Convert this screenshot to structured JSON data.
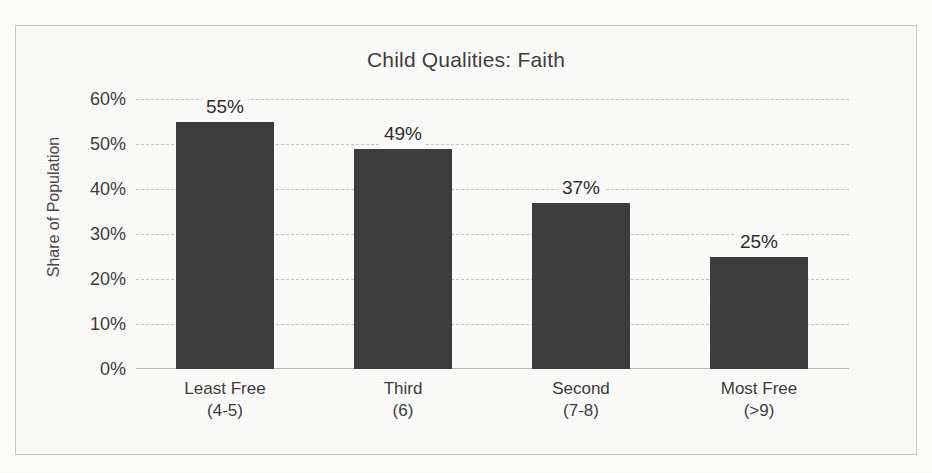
{
  "chart_data": {
    "type": "bar",
    "title": "Child Qualities: Faith",
    "xlabel": "",
    "ylabel": "Share of Population",
    "ylim": [
      0,
      60
    ],
    "grid": true,
    "legend": "none",
    "y_tick_labels": [
      "60%",
      "50%",
      "40%",
      "30%",
      "20%",
      "10%",
      "0%"
    ],
    "y_tick_values": [
      60,
      50,
      40,
      30,
      20,
      10,
      0
    ],
    "categories": [
      "Least Free",
      "Third",
      "Second",
      "Most Free"
    ],
    "category_sublabels": [
      "(4-5)",
      "(6)",
      "(7-8)",
      "(>9)"
    ],
    "values": [
      55,
      49,
      37,
      25
    ],
    "data_labels": [
      "55%",
      "49%",
      "37%",
      "25%"
    ],
    "bar_color": "#3d3d3d",
    "gridline_color": "#c4c4c2",
    "axis_color": "#b9b9b6",
    "border_color": "#c9c9c6",
    "background_color": "#fbfbfa"
  }
}
